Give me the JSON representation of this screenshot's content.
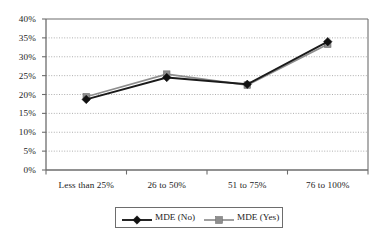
{
  "chart_data": {
    "type": "line",
    "title": "",
    "subtitle": "",
    "xlabel": "",
    "ylabel": "",
    "categories": [
      "Less than 25%",
      "26 to 50%",
      "51 to 75%",
      "76 to 100%"
    ],
    "series": [
      {
        "name": "MDE (No)",
        "color": "#1a1a1a",
        "marker": "diamond",
        "values": [
          18.7,
          24.5,
          22.7,
          34.0
        ],
        "value_labels": [
          "18.7%",
          "24.5%",
          "22.7%",
          "34.0%"
        ]
      },
      {
        "name": "MDE (Yes)",
        "color": "#8e8e8e",
        "marker": "square",
        "values": [
          19.4,
          25.4,
          22.5,
          33.3
        ],
        "value_labels": [
          "19.4%",
          "25.4%",
          "22.5%",
          "33.3%"
        ]
      }
    ],
    "ylim": [
      0,
      40
    ],
    "ytick_values": [
      0,
      5,
      10,
      15,
      20,
      25,
      30,
      35,
      40
    ],
    "ytick_labels": [
      "0%",
      "5%",
      "10%",
      "15%",
      "20%",
      "25%",
      "30%",
      "35%",
      "40%"
    ],
    "grid": {
      "horizontal": true,
      "vertical": false,
      "style": "dotted",
      "color": "#9a9a9a"
    },
    "legend": {
      "position": "bottom",
      "bordered": true,
      "entries": [
        {
          "label": "MDE (No)",
          "color": "#1a1a1a",
          "marker": "diamond"
        },
        {
          "label": "MDE (Yes)",
          "color": "#8e8e8e",
          "marker": "square"
        }
      ]
    },
    "axes": {
      "axis_line_color": "#6d6d6d",
      "plot_border": true,
      "plot_background": "#ffffff"
    }
  }
}
